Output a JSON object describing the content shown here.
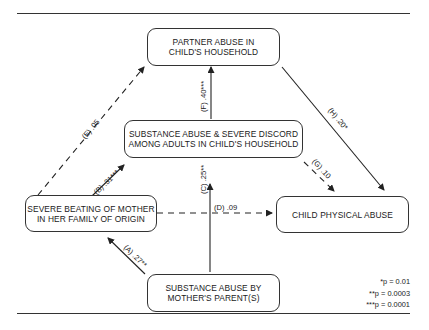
{
  "nodes": {
    "partner_abuse": {
      "line1": "PARTNER ABUSE IN",
      "line2": "CHILD'S HOUSEHOLD"
    },
    "substance_discord": {
      "line1": "SUBSTANCE ABUSE & SEVERE DISCORD",
      "line2": "AMONG ADULTS  IN CHILD'S HOUSEHOLD"
    },
    "severe_beating": {
      "line1": "SEVERE BEATING OF MOTHER",
      "line2": "IN HER FAMILY OF ORIGIN"
    },
    "child_abuse": {
      "line1": "CHILD PHYSICAL ABUSE"
    },
    "substance_parent": {
      "line1": "SUBSTANCE ABUSE BY",
      "line2": "MOTHER'S PARENT(S)"
    }
  },
  "edges": [
    {
      "id": "A",
      "label": "(A)  .27**",
      "from": "substance_parent",
      "to": "severe_beating",
      "style": "solid"
    },
    {
      "id": "B",
      "label": "(B)  .31***",
      "from": "severe_beating",
      "to": "substance_discord",
      "style": "solid"
    },
    {
      "id": "C",
      "label": "(C)  .25**",
      "from": "substance_parent",
      "to": "substance_discord",
      "style": "solid"
    },
    {
      "id": "D",
      "label": "(D)  .09",
      "from": "severe_beating",
      "to": "child_abuse",
      "style": "dashed"
    },
    {
      "id": "E",
      "label": "(E)  .05",
      "from": "severe_beating",
      "to": "partner_abuse",
      "style": "dashed"
    },
    {
      "id": "F",
      "label": "(F)  .40***",
      "from": "substance_discord",
      "to": "partner_abuse",
      "style": "solid"
    },
    {
      "id": "G",
      "label": "(G)  .10",
      "from": "substance_discord",
      "to": "child_abuse",
      "style": "dashed"
    },
    {
      "id": "H",
      "label": "(H)  .20*",
      "from": "partner_abuse",
      "to": "child_abuse",
      "style": "solid"
    }
  ],
  "legend": [
    "*p = 0.01",
    "**p = 0.0003",
    "***p = 0.0001"
  ]
}
